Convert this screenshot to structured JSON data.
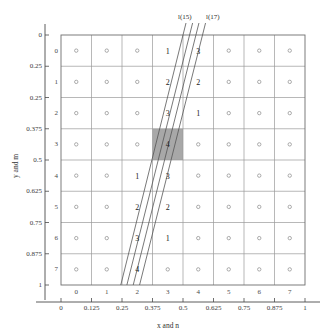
{
  "figure": {
    "title": "",
    "axes": {
      "x_label": "x and n",
      "y_label": "y and m",
      "x_ticks": [
        "0",
        "0.125",
        "0.25",
        "0.375",
        "0.5",
        "0.625",
        "0.75",
        "0.875",
        "1"
      ],
      "y_ticks": [
        "0",
        "0.25",
        "0.25",
        "0.375",
        "0.5",
        "0.625",
        "0.75",
        "0.875",
        "1"
      ],
      "x_index_labels": [
        "0",
        "1",
        "2",
        "3",
        "4",
        "5",
        "6",
        "7"
      ],
      "y_index_labels": [
        "0",
        "1",
        "2",
        "3",
        "4",
        "5",
        "6",
        "7"
      ]
    },
    "line_labels": [
      "l(15)",
      "l(17)"
    ],
    "grid": {
      "rows": 8,
      "cols": 8,
      "marker": "o"
    },
    "highlight_cell": {
      "row": 3,
      "col": 3,
      "value": "4",
      "color": "#a8a8a8"
    },
    "cell_values": [
      {
        "row": 0,
        "col": 3,
        "value": "1"
      },
      {
        "row": 0,
        "col": 4,
        "value": "3"
      },
      {
        "row": 1,
        "col": 3,
        "value": "2"
      },
      {
        "row": 1,
        "col": 4,
        "value": "2"
      },
      {
        "row": 2,
        "col": 3,
        "value": "3"
      },
      {
        "row": 2,
        "col": 4,
        "value": "1"
      },
      {
        "row": 4,
        "col": 2,
        "value": "1"
      },
      {
        "row": 4,
        "col": 3,
        "value": "3"
      },
      {
        "row": 5,
        "col": 2,
        "value": "2"
      },
      {
        "row": 5,
        "col": 3,
        "value": "2"
      },
      {
        "row": 6,
        "col": 2,
        "value": "3"
      },
      {
        "row": 6,
        "col": 3,
        "value": "1"
      },
      {
        "row": 7,
        "col": 2,
        "value": "4"
      }
    ],
    "colors": {
      "grid_line": "#9a9a9a",
      "box_line": "#6e6e6e",
      "ray_line": "#555555",
      "highlight": "#a8a8a8",
      "text": "#2b2b2b"
    }
  },
  "chart_data": {
    "type": "scatter",
    "title": "",
    "xlabel": "x and n",
    "ylabel": "y and m",
    "xlim": [
      0,
      1
    ],
    "ylim": [
      1,
      0
    ],
    "grid": true,
    "legend": [
      "l(15)",
      "l(17)"
    ],
    "x_tick_values": [
      0,
      0.125,
      0.25,
      0.375,
      0.5,
      0.625,
      0.75,
      0.875,
      1
    ],
    "y_tick_values": [
      0,
      0.25,
      0.25,
      0.375,
      0.5,
      0.625,
      0.75,
      0.875,
      1
    ],
    "pixel_centers_n": [
      0,
      1,
      2,
      3,
      4,
      5,
      6,
      7
    ],
    "pixel_centers_m": [
      0,
      1,
      2,
      3,
      4,
      5,
      6,
      7
    ],
    "annotated_cells": [
      {
        "n": 3,
        "m": 0,
        "label": "1"
      },
      {
        "n": 4,
        "m": 0,
        "label": "3"
      },
      {
        "n": 3,
        "m": 1,
        "label": "2"
      },
      {
        "n": 4,
        "m": 1,
        "label": "2"
      },
      {
        "n": 3,
        "m": 2,
        "label": "3"
      },
      {
        "n": 4,
        "m": 2,
        "label": "1"
      },
      {
        "n": 3,
        "m": 3,
        "label": "4"
      },
      {
        "n": 2,
        "m": 4,
        "label": "1"
      },
      {
        "n": 3,
        "m": 4,
        "label": "3"
      },
      {
        "n": 2,
        "m": 5,
        "label": "2"
      },
      {
        "n": 3,
        "m": 5,
        "label": "2"
      },
      {
        "n": 2,
        "m": 6,
        "label": "3"
      },
      {
        "n": 3,
        "m": 6,
        "label": "1"
      },
      {
        "n": 2,
        "m": 7,
        "label": "4"
      }
    ],
    "rays": [
      {
        "name": "ray-1",
        "x_bottom": 0.245,
        "x_top": 0.5
      },
      {
        "name": "ray-2",
        "x_bottom": 0.27,
        "x_top": 0.527
      },
      {
        "name": "ray-3",
        "x_bottom": 0.296,
        "x_top": 0.553
      },
      {
        "name": "ray-4",
        "x_bottom": 0.322,
        "x_top": 0.58
      }
    ]
  }
}
